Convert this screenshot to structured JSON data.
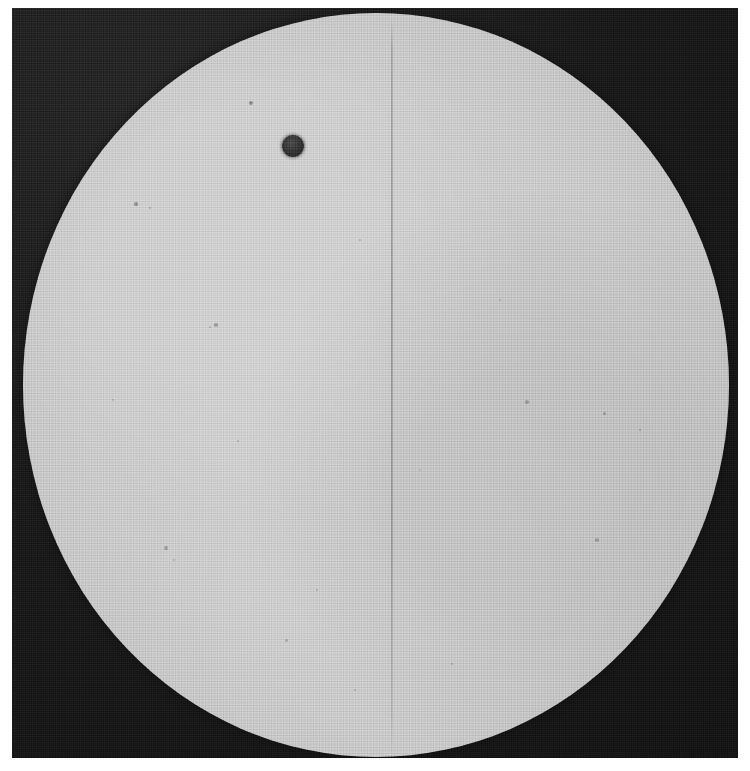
{
  "image": {
    "kind": "halftone-printed-photograph",
    "subject": "solar disk with a small dark circular body in transit",
    "canvas": {
      "width": 750,
      "height": 771
    },
    "page_background": "#ffffff"
  },
  "plate": {
    "name": "photographic-plate",
    "x": 12,
    "y": 8,
    "width": 726,
    "height": 750,
    "sky_color": "#151515",
    "sky_color_light": "#232323"
  },
  "solar_disk": {
    "name": "solar-disk",
    "center_x": 376,
    "center_y": 385,
    "radius_x": 353,
    "radius_y": 372,
    "surface_color": "#cfcfcf",
    "limb_color": "#8d8d8d",
    "limb_darkening": true,
    "clipped_at_top": true
  },
  "transiting_body": {
    "name": "transiting-planet-disk",
    "center_x": 293,
    "center_y": 146,
    "radius": 11,
    "color": "#2e2e2e"
  },
  "reticle": {
    "name": "vertical-reticle-line",
    "x": 391,
    "top": 18,
    "bottom": 758,
    "color": "#000000",
    "opacity": 0.22
  },
  "flecks": [
    {
      "x": 251,
      "y": 103,
      "r": 2.0,
      "o": 0.45
    },
    {
      "x": 136,
      "y": 204,
      "r": 1.6,
      "o": 0.4
    },
    {
      "x": 150,
      "y": 208,
      "r": 1.2,
      "o": 0.3
    },
    {
      "x": 216,
      "y": 325,
      "r": 1.8,
      "o": 0.35
    },
    {
      "x": 210,
      "y": 327,
      "r": 1.3,
      "o": 0.28
    },
    {
      "x": 360,
      "y": 240,
      "r": 1.4,
      "o": 0.26
    },
    {
      "x": 527,
      "y": 402,
      "r": 1.6,
      "o": 0.3
    },
    {
      "x": 604,
      "y": 413,
      "r": 1.5,
      "o": 0.32
    },
    {
      "x": 640,
      "y": 430,
      "r": 1.3,
      "o": 0.26
    },
    {
      "x": 597,
      "y": 540,
      "r": 1.7,
      "o": 0.3
    },
    {
      "x": 166,
      "y": 548,
      "r": 1.6,
      "o": 0.3
    },
    {
      "x": 174,
      "y": 560,
      "r": 1.2,
      "o": 0.24
    },
    {
      "x": 317,
      "y": 590,
      "r": 1.4,
      "o": 0.26
    },
    {
      "x": 286,
      "y": 640,
      "r": 1.5,
      "o": 0.28
    },
    {
      "x": 452,
      "y": 664,
      "r": 1.4,
      "o": 0.26
    },
    {
      "x": 238,
      "y": 441,
      "r": 1.2,
      "o": 0.22
    },
    {
      "x": 500,
      "y": 300,
      "r": 1.2,
      "o": 0.2
    },
    {
      "x": 420,
      "y": 470,
      "r": 1.1,
      "o": 0.2
    },
    {
      "x": 355,
      "y": 690,
      "r": 1.3,
      "o": 0.24
    },
    {
      "x": 113,
      "y": 400,
      "r": 1.2,
      "o": 0.22
    }
  ]
}
